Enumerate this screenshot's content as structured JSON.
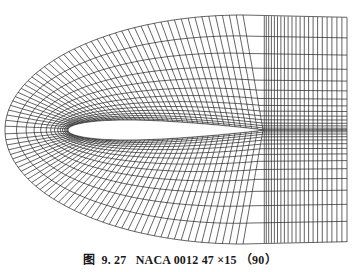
{
  "figure": {
    "caption": {
      "prefix": "图",
      "number": "9. 27",
      "title": "NACA 0012 47 ×15 （90）"
    },
    "mesh": {
      "type": "C-grid",
      "airfoil": "NACA 0012",
      "line_color": "#222222",
      "leading_edge": [
        68,
        130
      ],
      "trailing_edge": [
        263,
        130
      ],
      "outer_left_x": 5,
      "top_y": 15,
      "bottom_y": 244,
      "right_x": 347,
      "radial_lines": 15,
      "wrap_lines": 47,
      "wake_lines": 22
    }
  }
}
